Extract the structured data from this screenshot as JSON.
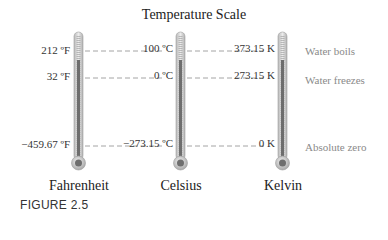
{
  "title": "Temperature Scale",
  "figure_label": "FIGURE 2.5",
  "scales": [
    {
      "name": "Fahrenheit",
      "x": 78,
      "values": {
        "boils": "212 ºF",
        "freezes": "32 ºF",
        "zero": "−459.67 ºF"
      }
    },
    {
      "name": "Celsius",
      "x": 180,
      "values": {
        "boils": "100 ºC",
        "freezes": "0 ºC",
        "zero": "−273.15 ºC"
      }
    },
    {
      "name": "Kelvin",
      "x": 282,
      "values": {
        "boils": "373.15 K",
        "freezes": "273.15 K",
        "zero": "0 K"
      }
    }
  ],
  "reference_points": [
    {
      "label": "Water boils",
      "y": 51
    },
    {
      "label": "Water freezes",
      "y": 78
    },
    {
      "label": "Absolute zero",
      "y": 146
    }
  ],
  "colors": {
    "text": "#222222",
    "note": "#8a8a8a",
    "dashed_line": "#9a9a9a",
    "thermometer_glass": "#cfcfcf",
    "mercury": "#6e6e6e"
  }
}
